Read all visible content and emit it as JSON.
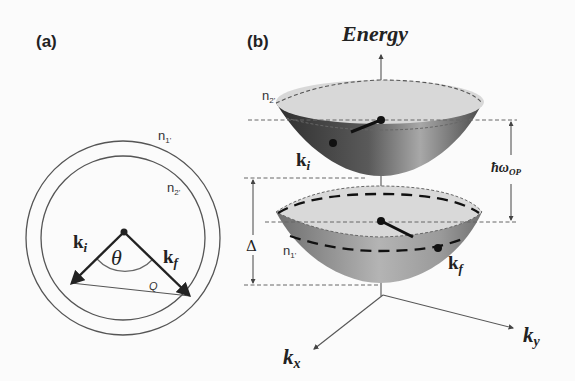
{
  "figure": {
    "panel_a": {
      "label": "(a)",
      "outer_circle_label": "n",
      "outer_circle_sub": "1'",
      "inner_circle_label": "n",
      "inner_circle_sub": "2'",
      "ki_label": "k",
      "ki_sub": "i",
      "kf_label": "k",
      "kf_sub": "f",
      "angle_label": "θ",
      "q_label": "Q"
    },
    "panel_b": {
      "label": "(b)",
      "energy_axis_label": "Energy",
      "upper_band_label": "n",
      "upper_band_sub": "2'",
      "lower_band_label": "n",
      "lower_band_sub": "1'",
      "ki_label": "k",
      "ki_sub": "i",
      "kf_label": "k",
      "kf_sub": "f",
      "phonon_energy_label": "ħω",
      "phonon_energy_sub": "OP",
      "gap_label": "Δ",
      "kx_label": "k",
      "kx_sub": "x",
      "ky_label": "k",
      "ky_sub": "y"
    },
    "colors": {
      "line": "#333333",
      "rim_fill": "#dcdcdc",
      "bowl_dark": "#3a3a3a",
      "bowl_mid": "#8a8a8a",
      "bowl_light": "#cfcfcf",
      "dashed": "#666666"
    }
  }
}
